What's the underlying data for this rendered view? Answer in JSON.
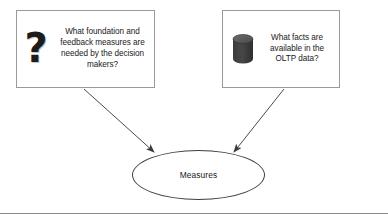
{
  "diagram": {
    "background_color": "#ffffff",
    "boxes": [
      {
        "id": "foundation",
        "icon": "question-mark-icon",
        "text": "What foundation and feedback measures are needed by the decision makers?",
        "lines": [
          "What foundation and",
          "feedback measures are",
          "needed by the decision",
          "makers?"
        ],
        "border_color": "#9a9a9a",
        "fill_color": "#ffffff"
      },
      {
        "id": "oltp",
        "icon": "database-cylinder-icon",
        "text": "What facts are available in the OLTP data?",
        "lines": [
          "What facts are",
          "available in the",
          "OLTP data?"
        ],
        "border_color": "#9a9a9a",
        "fill_color": "#ffffff"
      }
    ],
    "node": {
      "id": "measures",
      "shape": "ellipse",
      "label": "Measures",
      "border_color": "#3f3f3f",
      "fill_color": "#ffffff"
    },
    "connectors": [
      {
        "id": "foundation-to-measures",
        "from": "foundation",
        "to": "measures",
        "style": "solid-arrow",
        "color": "#4a4a4a"
      },
      {
        "id": "oltp-to-measures",
        "from": "oltp",
        "to": "measures",
        "style": "solid-arrow",
        "color": "#4a4a4a"
      }
    ],
    "divider": {
      "id": "bottom-rule",
      "color": "#8d8d8d"
    }
  }
}
